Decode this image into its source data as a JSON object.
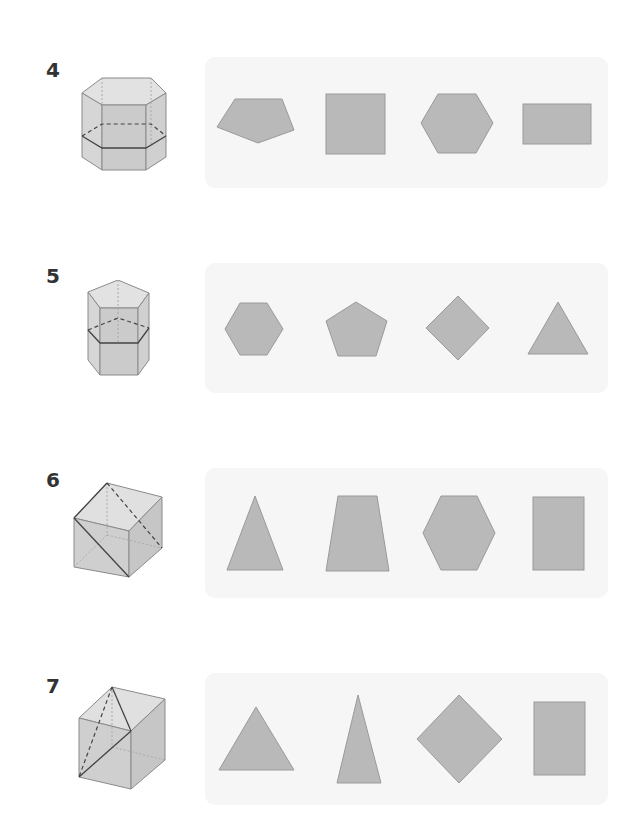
{
  "colors": {
    "shape_fill": "#b9b9b9",
    "shape_stroke": "#9a9a9a",
    "panel_bg": "#f6f6f6",
    "solid_face": "#d4d4d4",
    "label": "#333333"
  },
  "problems": [
    {
      "number": "4",
      "solid": "hexagonal-prism-horizontal-cut",
      "options": [
        "pentagon",
        "square",
        "hexagon",
        "rectangle"
      ]
    },
    {
      "number": "5",
      "solid": "pentagonal-prism-horizontal-cut",
      "options": [
        "hexagon",
        "pentagon",
        "square-rotated",
        "triangle"
      ]
    },
    {
      "number": "6",
      "solid": "cube-diagonal-plane-cut",
      "options": [
        "triangle",
        "trapezoid",
        "hexagon",
        "rectangle"
      ]
    },
    {
      "number": "7",
      "solid": "cube-corner-triangle-cut",
      "options": [
        "triangle",
        "narrow-triangle",
        "square-rotated",
        "rectangle"
      ]
    }
  ]
}
